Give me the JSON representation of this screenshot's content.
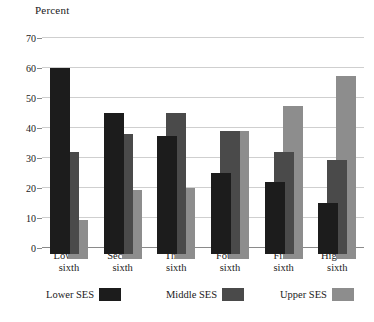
{
  "chart_data": {
    "type": "bar",
    "title": "Percent",
    "xlabel": "",
    "ylabel": "Percent",
    "ylim": [
      0,
      70
    ],
    "yticks": [
      0,
      10,
      20,
      30,
      40,
      50,
      60,
      70
    ],
    "grid": true,
    "legend_position": "bottom",
    "categories": [
      "Lowest sixth",
      "Second sixth",
      "Third sixth",
      "Fourth sixth",
      "Fifth sixth",
      "Highest sixth"
    ],
    "category_lines": [
      [
        "Lowest",
        "sixth"
      ],
      [
        "Second",
        "sixth"
      ],
      [
        "Third",
        "sixth"
      ],
      [
        "Fourth",
        "sixth"
      ],
      [
        "Fifth",
        "sixth"
      ],
      [
        "Highest",
        "sixth"
      ]
    ],
    "series": [
      {
        "name": "Lower SES",
        "color": "#1c1c1c",
        "values": [
          60,
          45,
          37.5,
          25,
          22,
          15
        ]
      },
      {
        "name": "Middle SES",
        "color": "#4a4a4a",
        "values": [
          32,
          38,
          45,
          39,
          32,
          29.5
        ]
      },
      {
        "name": "Upper SES",
        "color": "#8d8d8d",
        "values": [
          9.5,
          19.5,
          20,
          39,
          47.5,
          57.5
        ]
      }
    ]
  },
  "legend": {
    "items": [
      {
        "label": "Lower SES",
        "color": "#1c1c1c"
      },
      {
        "label": "Middle SES",
        "color": "#4a4a4a"
      },
      {
        "label": "Upper SES",
        "color": "#8d8d8d"
      }
    ]
  },
  "colors": {
    "gridline": "#cfcfcf",
    "axis": "#8a8a8a",
    "text": "#1a1a1a",
    "background": "#ffffff"
  }
}
